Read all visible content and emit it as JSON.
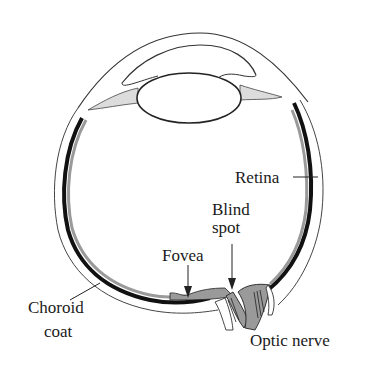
{
  "diagram": {
    "labels": {
      "retina": "Retina",
      "blind_spot_line1": "Blind",
      "blind_spot_line2": "spot",
      "fovea": "Fovea",
      "choroid_line1": "Choroid",
      "choroid_line2": "coat",
      "optic_nerve": "Optic nerve"
    },
    "colors": {
      "outline": "#333333",
      "retina_fill": "#9a9a9a",
      "choroid": "#111111",
      "background": "#ffffff",
      "ciliary_fill": "#d8d8d8"
    }
  }
}
